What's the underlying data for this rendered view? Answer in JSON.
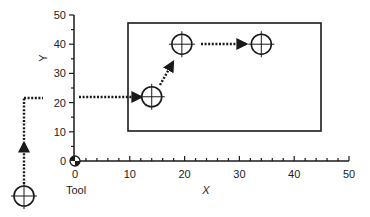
{
  "diagram": {
    "title": "",
    "axes": {
      "x": {
        "label": "X",
        "min": 0,
        "max": 50,
        "major_step": 10,
        "minor_step": 2,
        "tick_labels": [
          "0",
          "10",
          "20",
          "30",
          "40",
          "50"
        ]
      },
      "y": {
        "label": "Y",
        "min": 0,
        "max": 50,
        "major_step": 10,
        "minor_step": 5,
        "tick_labels": [
          "0",
          "10",
          "20",
          "30",
          "40",
          "50"
        ]
      },
      "origin_label": "0"
    },
    "tool_label": "Tool",
    "workpiece_rect": {
      "x1": 10,
      "y1": 10,
      "x2": 45,
      "y2": 47
    },
    "tool_start": {
      "note": "tool shown below and left of origin"
    },
    "holes": [
      {
        "id": "A",
        "x": 14,
        "y": 22
      },
      {
        "id": "B",
        "x": 19.5,
        "y": 40
      },
      {
        "id": "C",
        "x": 34,
        "y": 40
      }
    ],
    "path_segments": [
      {
        "from": "tool",
        "to": "up",
        "style": "dotted-arrow"
      },
      {
        "from": "left",
        "to": "A",
        "style": "dotted-arrow"
      },
      {
        "from": "A",
        "to": "B",
        "style": "dotted-arrow"
      },
      {
        "from": "B",
        "to": "C",
        "style": "dotted-arrow"
      }
    ],
    "colors": {
      "ink": "#1a1a1a",
      "background": "#ffffff"
    }
  }
}
